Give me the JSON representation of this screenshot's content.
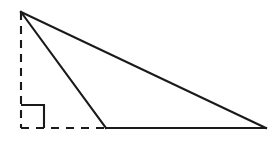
{
  "figure": {
    "background_color": "#ffffff",
    "stroke_color": "#1a1a1a",
    "stroke_width": 2.1,
    "canvas": {
      "width": 276,
      "height": 141
    },
    "points": {
      "apex": {
        "label": "apex",
        "x": 21,
        "y": 12
      },
      "base_left": {
        "label": "base-left",
        "x": 106,
        "y": 128
      },
      "base_right": {
        "label": "base-right",
        "x": 266,
        "y": 128
      },
      "foot": {
        "label": "altitude-foot",
        "x": 21,
        "y": 128
      }
    },
    "solid_edges": [
      {
        "name": "hypotenuse",
        "from": "apex",
        "to": "base_right",
        "style": "solid"
      },
      {
        "name": "short-leg",
        "from": "apex",
        "to": "base_left",
        "style": "solid"
      },
      {
        "name": "base",
        "from": "base_left",
        "to": "base_right",
        "style": "solid"
      }
    ],
    "dashed_edges": [
      {
        "name": "altitude",
        "from": "apex",
        "to": "foot",
        "style": "dashed",
        "orientation": "vertical"
      },
      {
        "name": "base-extension",
        "from": "foot",
        "to": "base_left",
        "style": "dashed",
        "orientation": "horizontal"
      }
    ],
    "angle_marker": {
      "name": "right-angle-marker",
      "type": "square",
      "at": "foot",
      "size": 23,
      "degrees": 90
    },
    "dash_pattern": {
      "dash": 8,
      "gap": 7
    }
  }
}
